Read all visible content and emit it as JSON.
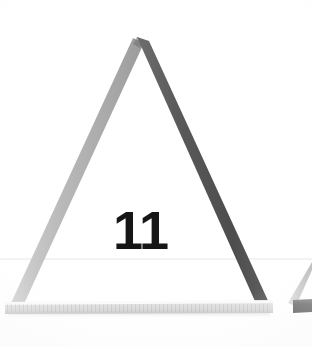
{
  "figure": {
    "label": "11",
    "kind": "photograph-of-physical-triangle",
    "background_color": "#ffffff",
    "canvas": {
      "width": 312,
      "height": 347
    }
  },
  "scene": {
    "description": "Three straight rulers arranged as a tall isosceles triangle resting on a white surface, photographed from the front.",
    "horizon": {
      "name": "table-edge-line",
      "y": 258,
      "color": "#e8e8e8"
    },
    "triangle": {
      "name": "main-triangle",
      "apex": {
        "x": 140,
        "y": 40
      },
      "left_foot": {
        "x": 12,
        "y": 304
      },
      "right_foot": {
        "x": 268,
        "y": 304
      },
      "legs": [
        {
          "name": "left-leg",
          "color": "#b4b4b4",
          "shadow_color": "#9a9a9a",
          "highlight_color": "#d2d2d2",
          "thickness": 11
        },
        {
          "name": "right-leg",
          "color": "#585858",
          "shadow_color": "#3f3f3f",
          "highlight_color": "#777777",
          "thickness": 12
        }
      ],
      "base": {
        "name": "base-ruler",
        "color": "#dcdcdc",
        "top_edge_color": "#f2f2f2",
        "bottom_edge_color": "#c4c4c4",
        "left_x": 5,
        "right_x": 273,
        "top_y": 301,
        "bottom_y": 313
      }
    },
    "partial_triangle": {
      "name": "partial-triangle-right-edge",
      "description": "Edge of a neighbouring triangle cropped by the right border of the photograph.",
      "diagonal_color": "#cfcfcf",
      "base_color": "#6e6e6e",
      "base_left_x": 293,
      "base_right_x": 312,
      "base_top_y": 300,
      "base_bottom_y": 312
    }
  },
  "caption": {
    "number": "11",
    "x": 113,
    "y": 206,
    "color": "#161616"
  }
}
